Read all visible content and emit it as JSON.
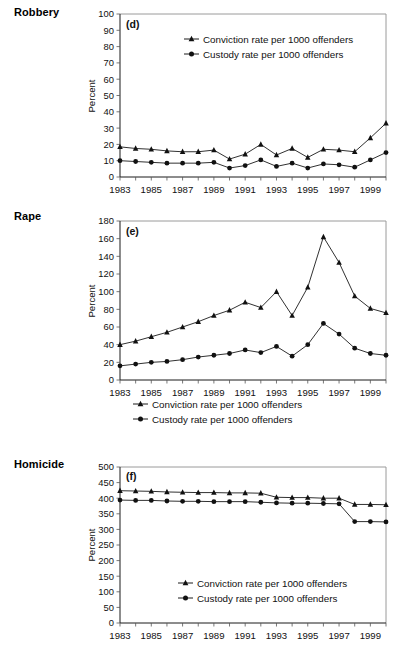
{
  "figure": {
    "background": "#ffffff",
    "line_color": "#1a1a1a",
    "frame_color": "#9a9a9a",
    "row_labels": [
      "Robbery",
      "Rape",
      "Homicide"
    ]
  },
  "panels": [
    {
      "id": "robbery",
      "row_label": "Robbery",
      "letter": "(d)",
      "legend_position": "inside-top",
      "ylabel": "Percent"
    },
    {
      "id": "rape",
      "row_label": "Rape",
      "letter": "(e)",
      "legend_position": "below-axis",
      "ylabel": "Percent"
    },
    {
      "id": "homicide",
      "row_label": "Homicide",
      "letter": "(f)",
      "legend_position": "inside-bottom",
      "ylabel": "Percent"
    }
  ],
  "legend": {
    "conviction": "Conviction rate per 1000 offenders",
    "custody": "Custody rate per 1000 offenders",
    "conviction_marker": "triangle-marker",
    "custody_marker": "circle-marker"
  },
  "chart_data": [
    {
      "type": "line",
      "id": "robbery",
      "title": "Robbery",
      "panel_letter": "(d)",
      "xlabel": "",
      "ylabel": "Percent",
      "grid": false,
      "legend_position": "inside-top",
      "xlim": [
        1983,
        2000
      ],
      "ylim": [
        0,
        100
      ],
      "yticks": [
        0,
        10,
        20,
        30,
        40,
        50,
        60,
        70,
        80,
        90,
        100
      ],
      "xticks": [
        1983,
        1985,
        1987,
        1989,
        1991,
        1993,
        1995,
        1997,
        1999
      ],
      "xtick_labels": [
        "1983",
        "1985",
        "1987",
        "1989",
        "1991",
        "1993",
        "1995",
        "1997",
        "1999"
      ],
      "x": [
        1983,
        1984,
        1985,
        1986,
        1987,
        1988,
        1989,
        1990,
        1991,
        1992,
        1993,
        1994,
        1995,
        1996,
        1997,
        1998,
        1999,
        2000
      ],
      "series": [
        {
          "name": "Conviction rate per 1000 offenders",
          "marker": "triangle",
          "values": [
            18.5,
            17.5,
            17.0,
            16.0,
            15.5,
            15.5,
            16.5,
            11.0,
            14.0,
            20.0,
            13.5,
            17.5,
            12.0,
            17.0,
            16.5,
            15.5,
            24.0,
            33.0
          ]
        },
        {
          "name": "Custody rate per 1000 offenders",
          "marker": "circle",
          "values": [
            10.0,
            9.5,
            9.0,
            8.5,
            8.5,
            8.5,
            9.0,
            5.5,
            7.0,
            10.5,
            6.5,
            8.5,
            5.5,
            8.0,
            7.5,
            6.0,
            10.5,
            15.0
          ]
        }
      ]
    },
    {
      "type": "line",
      "id": "rape",
      "title": "Rape",
      "panel_letter": "(e)",
      "xlabel": "",
      "ylabel": "Percent",
      "grid": false,
      "legend_position": "below-axis",
      "xlim": [
        1983,
        2000
      ],
      "ylim": [
        0,
        180
      ],
      "yticks": [
        0,
        20,
        40,
        60,
        80,
        100,
        120,
        140,
        160,
        180
      ],
      "xticks": [
        1983,
        1985,
        1987,
        1989,
        1991,
        1993,
        1995,
        1997,
        1999
      ],
      "xtick_labels": [
        "1983",
        "1985",
        "1987",
        "1989",
        "1991",
        "1993",
        "1995",
        "1997",
        "1999"
      ],
      "x": [
        1983,
        1984,
        1985,
        1986,
        1987,
        1988,
        1989,
        1990,
        1991,
        1992,
        1993,
        1994,
        1995,
        1996,
        1997,
        1998,
        1999,
        2000
      ],
      "series": [
        {
          "name": "Conviction rate per 1000 offenders",
          "marker": "triangle",
          "values": [
            40,
            44,
            49,
            54,
            60,
            66,
            73,
            79,
            88,
            82,
            100,
            73,
            105,
            162,
            133,
            95,
            81,
            76
          ]
        },
        {
          "name": "Custody rate per 1000 offenders",
          "marker": "circle",
          "values": [
            16,
            18,
            20,
            21,
            23,
            26,
            28,
            30,
            34,
            31,
            38,
            27,
            40,
            64,
            52,
            36,
            30,
            28
          ]
        }
      ]
    },
    {
      "type": "line",
      "id": "homicide",
      "title": "Homicide",
      "panel_letter": "(f)",
      "xlabel": "",
      "ylabel": "Percent",
      "grid": false,
      "legend_position": "inside-bottom",
      "xlim": [
        1983,
        2000
      ],
      "ylim": [
        0,
        500
      ],
      "yticks": [
        0,
        50,
        100,
        150,
        200,
        250,
        300,
        350,
        400,
        450,
        500
      ],
      "xticks": [
        1983,
        1985,
        1987,
        1989,
        1991,
        1993,
        1995,
        1997,
        1999
      ],
      "xtick_labels": [
        "1983",
        "1985",
        "1987",
        "1989",
        "1991",
        "1993",
        "1995",
        "1997",
        "1999"
      ],
      "x": [
        1983,
        1984,
        1985,
        1986,
        1987,
        1988,
        1989,
        1990,
        1991,
        1992,
        1993,
        1994,
        1995,
        1996,
        1997,
        1998,
        1999,
        2000
      ],
      "series": [
        {
          "name": "Conviction rate per 1000 offenders",
          "marker": "triangle",
          "values": [
            424,
            423,
            422,
            420,
            419,
            418,
            418,
            417,
            417,
            416,
            403,
            402,
            402,
            400,
            400,
            380,
            380,
            379
          ]
        },
        {
          "name": "Custody rate per 1000 offenders",
          "marker": "circle",
          "values": [
            394,
            393,
            393,
            391,
            390,
            390,
            389,
            389,
            389,
            387,
            385,
            384,
            384,
            383,
            382,
            325,
            325,
            324
          ]
        }
      ]
    }
  ]
}
